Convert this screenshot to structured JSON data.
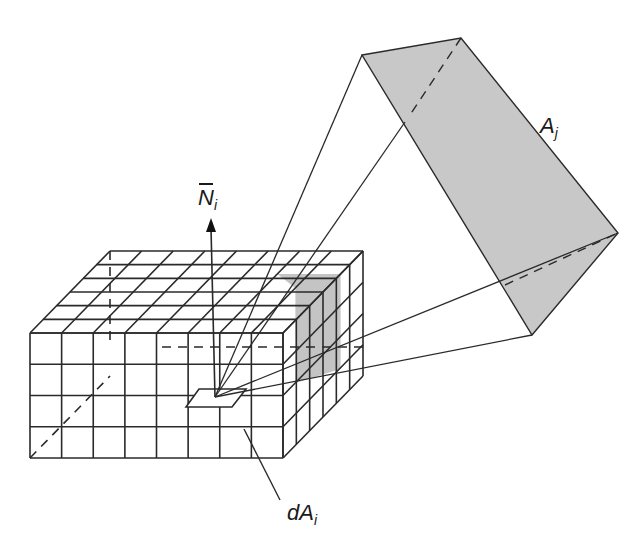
{
  "diagram": {
    "type": "hemicube-form-factor",
    "labels": {
      "normal": {
        "main": "N",
        "sub": "i",
        "overbar": true
      },
      "target_patch": {
        "main": "A",
        "sub": "j"
      },
      "differential_area": {
        "main": "dA",
        "sub": "i"
      }
    },
    "hemicube": {
      "front_columns": 8,
      "front_rows": 4,
      "depth_cells": 6
    },
    "colors": {
      "stroke": "#2a2a2a",
      "patch_fill": "#c8c8c8",
      "projection_fill": "#c4c4c4",
      "background": "#ffffff"
    }
  }
}
